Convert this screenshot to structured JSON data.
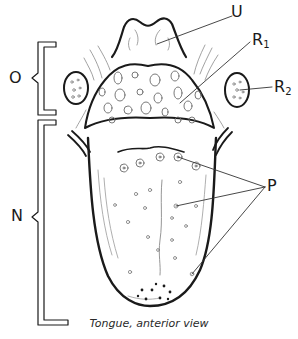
{
  "figure": {
    "caption": "Tongue, anterior view",
    "colors": {
      "ink": "#1a1a1a",
      "light_ink": "#8a8a8a",
      "background": "#ffffff"
    }
  },
  "labels": {
    "U": {
      "letter": "U",
      "sub": ""
    },
    "R1": {
      "letter": "R",
      "sub": "1"
    },
    "R2": {
      "letter": "R",
      "sub": "2"
    },
    "P": {
      "letter": "P",
      "sub": ""
    },
    "O": {
      "letter": "O",
      "sub": ""
    },
    "N": {
      "letter": "N",
      "sub": ""
    }
  }
}
